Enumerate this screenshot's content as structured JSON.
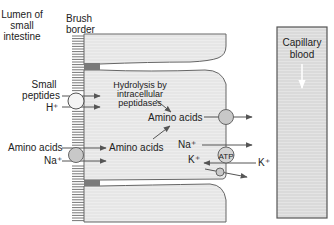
{
  "labels": {
    "lumen": [
      "Lumen of",
      "small",
      "intestine"
    ],
    "brush_border": [
      "Brush",
      "border"
    ],
    "small_peptides": [
      "Small",
      "peptides"
    ],
    "h_plus": "H⁺",
    "hydrolysis": [
      "Hydrolysis by",
      "intracellular",
      "peptidases"
    ],
    "amino_acids_upper": "Amino acids",
    "amino_acids_lumen": "Amino acids",
    "amino_acids_cell": "Amino acids",
    "na_plus_lumen": "Na⁺",
    "na_plus_cell": "Na⁺",
    "k_plus_cell": "K⁺",
    "k_plus_blood": "K⁺",
    "atp": "ATP",
    "capillary": [
      "Capillary",
      "blood"
    ]
  },
  "colors": {
    "cell_fill": "#e6e6e6",
    "membrane": "#666666",
    "transporter": "#c8c8c8",
    "capillary_fill": "#dcdcdc",
    "arrow": "#555555",
    "junction": "#7a7a7a"
  }
}
